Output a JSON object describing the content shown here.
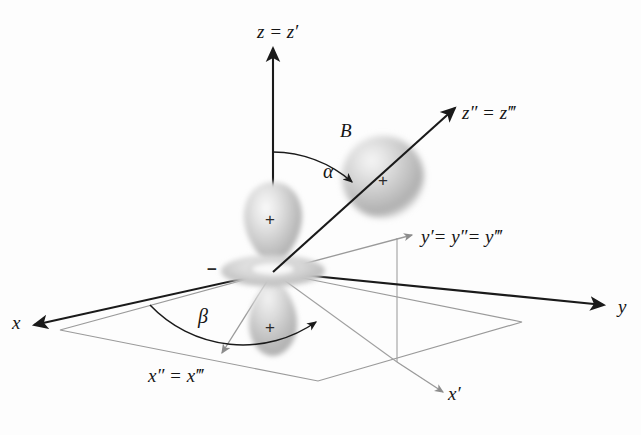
{
  "figure": {
    "background_color": "#fdfdfd",
    "axis_color": "#1a1a1a",
    "secondary_axis_color": "#8d8d8d",
    "orbital_color": "#b9b9b9"
  },
  "axes": {
    "z": {
      "label": "z = z′",
      "x": 257,
      "y": 22,
      "color": "#1a1a1a"
    },
    "y": {
      "label": "y",
      "x": 618,
      "y": 297,
      "color": "#1a1a1a"
    },
    "x": {
      "label": "x",
      "x": 12,
      "y": 313,
      "color": "#1a1a1a"
    },
    "z2": {
      "label": "z″ = z‴",
      "x": 462,
      "y": 103,
      "color": "#1a1a1a"
    },
    "y2": {
      "label": "y′= y″= y‴",
      "x": 421,
      "y": 227,
      "color": "#1a1a1a"
    },
    "x2": {
      "label": "x″ = x‴",
      "x": 148,
      "y": 366,
      "color": "#1a1a1a"
    },
    "x1": {
      "label": "x′",
      "x": 448,
      "y": 384,
      "color": "#1a1a1a"
    }
  },
  "angles": {
    "alpha": {
      "label": "α",
      "x": 323,
      "y": 161,
      "description": "angle between z and z″"
    },
    "beta": {
      "label": "β",
      "x": 198,
      "y": 306,
      "description": "angle between x and x″ in the xy plane"
    }
  },
  "atoms": {
    "b": {
      "label": "B",
      "x": 340,
      "y": 121,
      "sign": "+",
      "sign_x": 378,
      "sign_y": 172
    }
  },
  "orbital": {
    "name": "d z-squared orbital",
    "upper_lobe_sign": "+",
    "upper_lobe_sign_x": 265,
    "upper_lobe_sign_y": 211,
    "lower_lobe_sign": "+",
    "lower_lobe_sign_x": 265,
    "lower_lobe_sign_y": 319,
    "torus_sign": "−",
    "torus_sign_x": 207,
    "torus_sign_y": 261
  }
}
